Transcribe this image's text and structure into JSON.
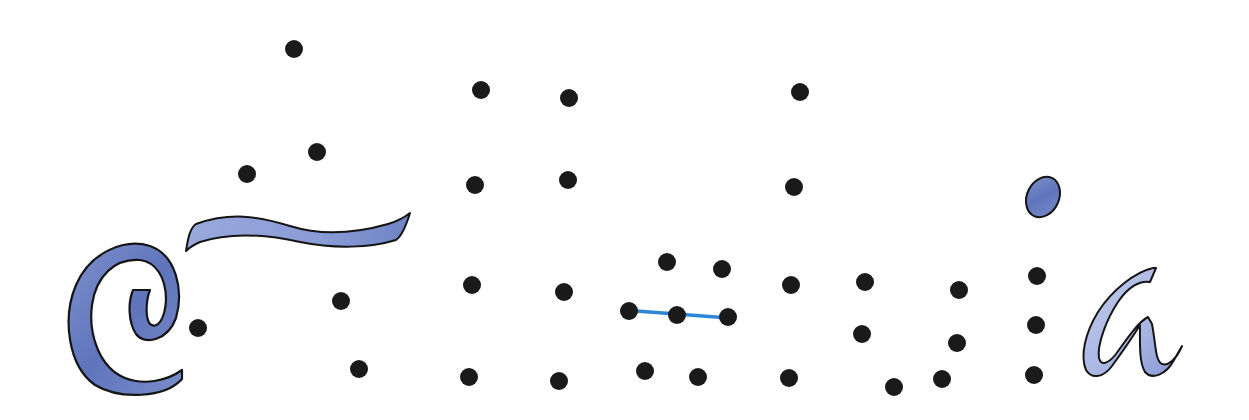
{
  "title": "Dot-to-dot puzzle",
  "colors": {
    "background": "#ffffff",
    "dot": "#1a1a1a",
    "ink_outline": "#151515",
    "watercolor_dark": "#6a7ec0",
    "watercolor_light": "#a9b6e0",
    "guide_line": "#2a86d9"
  },
  "dot_radius": 9,
  "dots": [
    {
      "x": 294,
      "y": 49
    },
    {
      "x": 317,
      "y": 152
    },
    {
      "x": 247,
      "y": 174
    },
    {
      "x": 198,
      "y": 328
    },
    {
      "x": 341,
      "y": 301
    },
    {
      "x": 359,
      "y": 369
    },
    {
      "x": 481,
      "y": 90
    },
    {
      "x": 569,
      "y": 98
    },
    {
      "x": 475,
      "y": 185
    },
    {
      "x": 568,
      "y": 180
    },
    {
      "x": 472,
      "y": 285
    },
    {
      "x": 564,
      "y": 292
    },
    {
      "x": 469,
      "y": 377
    },
    {
      "x": 559,
      "y": 381
    },
    {
      "x": 667,
      "y": 262
    },
    {
      "x": 722,
      "y": 269
    },
    {
      "x": 629,
      "y": 311
    },
    {
      "x": 677,
      "y": 315
    },
    {
      "x": 728,
      "y": 317
    },
    {
      "x": 645,
      "y": 371
    },
    {
      "x": 698,
      "y": 377
    },
    {
      "x": 800,
      "y": 92
    },
    {
      "x": 794,
      "y": 187
    },
    {
      "x": 791,
      "y": 285
    },
    {
      "x": 789,
      "y": 378
    },
    {
      "x": 865,
      "y": 282
    },
    {
      "x": 959,
      "y": 290
    },
    {
      "x": 862,
      "y": 334
    },
    {
      "x": 957,
      "y": 343
    },
    {
      "x": 894,
      "y": 387
    },
    {
      "x": 942,
      "y": 379
    },
    {
      "x": 1037,
      "y": 276
    },
    {
      "x": 1036,
      "y": 325
    },
    {
      "x": 1034,
      "y": 375
    }
  ],
  "guide_line": {
    "x1": 623,
    "y1": 310,
    "x2": 729,
    "y2": 318
  },
  "shapes": {
    "swirl": "watercolor spiral letter stroke",
    "ribbon": "watercolor tilde ribbon stroke",
    "oval": "watercolor dot over i",
    "letter_a": "watercolor cursive a"
  }
}
